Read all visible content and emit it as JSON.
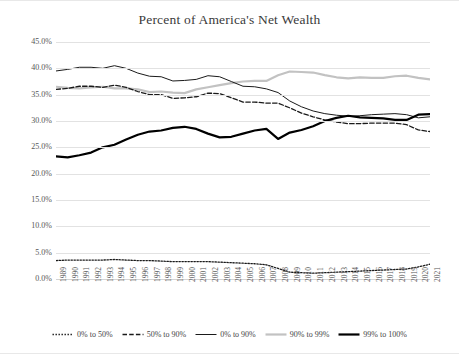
{
  "chart_data": {
    "type": "line",
    "title": "Percent of America's Net Wealth",
    "xlabel": "",
    "ylabel": "",
    "ylim": [
      0,
      45
    ],
    "ytick_labels": [
      "0.0%",
      "5.0%",
      "10.0%",
      "15.0%",
      "20.0%",
      "25.0%",
      "30.0%",
      "35.0%",
      "40.0%",
      "45.0%"
    ],
    "ytick_values": [
      0,
      5,
      10,
      15,
      20,
      25,
      30,
      35,
      40,
      45
    ],
    "grid": true,
    "legend_position": "bottom",
    "categories": [
      "1989",
      "1990",
      "1991",
      "1992",
      "1993",
      "1994",
      "1995",
      "1996",
      "1997",
      "1998",
      "1999",
      "2000",
      "2001",
      "2002",
      "2003",
      "2004",
      "2005",
      "2006",
      "2007",
      "2008",
      "2009",
      "2010",
      "2011",
      "2012",
      "2013",
      "2014",
      "2015",
      "2016",
      "2017",
      "2018",
      "2019",
      "2020",
      "2021"
    ],
    "series": [
      {
        "name": "0% to 50%",
        "style": "dotted",
        "color": "#1a1a1a",
        "values": [
          3.5,
          3.6,
          3.6,
          3.6,
          3.6,
          3.7,
          3.6,
          3.5,
          3.5,
          3.4,
          3.3,
          3.3,
          3.3,
          3.3,
          3.2,
          3.1,
          3.0,
          2.9,
          2.7,
          2.0,
          1.3,
          1.2,
          1.1,
          1.2,
          1.3,
          1.4,
          1.5,
          1.6,
          1.7,
          1.8,
          1.9,
          2.3,
          2.8
        ]
      },
      {
        "name": "50% to 90%",
        "style": "dashed",
        "color": "#1a1a1a",
        "values": [
          36.0,
          36.2,
          36.6,
          36.6,
          36.4,
          36.8,
          36.4,
          35.6,
          35.0,
          35.0,
          34.3,
          34.4,
          34.6,
          35.3,
          35.2,
          34.4,
          33.6,
          33.6,
          33.4,
          33.4,
          32.5,
          31.5,
          30.8,
          30.2,
          29.8,
          29.5,
          29.5,
          29.6,
          29.6,
          29.6,
          29.3,
          28.3,
          28.0
        ]
      },
      {
        "name": "0% to 90%",
        "style": "solid-thin",
        "color": "#1a1a1a",
        "values": [
          39.5,
          39.8,
          40.2,
          40.2,
          40.0,
          40.5,
          40.0,
          39.1,
          38.5,
          38.4,
          37.6,
          37.7,
          37.9,
          38.6,
          38.4,
          37.5,
          36.6,
          36.5,
          36.1,
          35.4,
          33.8,
          32.7,
          31.9,
          31.4,
          31.1,
          30.9,
          31.0,
          31.2,
          31.3,
          31.4,
          31.2,
          30.6,
          30.8
        ]
      },
      {
        "name": "90% to 99%",
        "style": "solid-thick-gray",
        "color": "#bfbfbf",
        "values": [
          36.5,
          36.3,
          36.2,
          36.4,
          36.5,
          36.2,
          36.2,
          36.0,
          35.5,
          35.6,
          35.4,
          35.3,
          36.0,
          36.4,
          36.8,
          37.2,
          37.5,
          37.6,
          37.6,
          38.7,
          39.4,
          39.3,
          39.2,
          38.7,
          38.3,
          38.1,
          38.3,
          38.2,
          38.2,
          38.5,
          38.6,
          38.2,
          37.9
        ]
      },
      {
        "name": "99% to 100%",
        "style": "solid-thick-black",
        "color": "#000000",
        "values": [
          23.3,
          23.1,
          23.5,
          24.0,
          25.0,
          25.5,
          26.5,
          27.4,
          28.0,
          28.2,
          28.7,
          28.9,
          28.5,
          27.6,
          26.9,
          27.0,
          27.6,
          28.2,
          28.5,
          26.6,
          27.8,
          28.3,
          29.0,
          30.0,
          30.6,
          31.0,
          30.7,
          30.6,
          30.5,
          30.2,
          30.2,
          31.2,
          31.3
        ]
      }
    ]
  },
  "legend": [
    {
      "label": "0% to 50%"
    },
    {
      "label": "50% to 90%"
    },
    {
      "label": "0% to 90%"
    },
    {
      "label": "90% to 99%"
    },
    {
      "label": "99% to 100%"
    }
  ]
}
